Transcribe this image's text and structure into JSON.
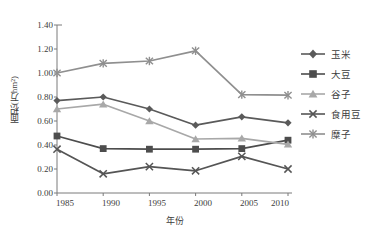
{
  "chart_data": {
    "type": "line",
    "title": "",
    "xlabel": "年份",
    "ylabel": "面积(万hm²)",
    "categories": [
      "1985",
      "1990",
      "1995",
      "2000",
      "2005",
      "2010"
    ],
    "x": [
      1985,
      1990,
      1995,
      2000,
      2005,
      2010
    ],
    "ylim": [
      0.0,
      1.4
    ],
    "ytick_labels": [
      "0.00",
      "0.20",
      "0.40",
      "0.60",
      "0.80",
      "1.00",
      "1.20",
      "1.40"
    ],
    "ytick_values": [
      0.0,
      0.2,
      0.4,
      0.6,
      0.8,
      1.0,
      1.2,
      1.4
    ],
    "grid": false,
    "legend_position": "right",
    "series": [
      {
        "name": "玉米",
        "marker": "diamond",
        "color": "#5a5a5a",
        "values": [
          0.77,
          0.8,
          0.7,
          0.565,
          0.635,
          0.585
        ]
      },
      {
        "name": "大豆",
        "marker": "square",
        "color": "#4d4d4d",
        "values": [
          0.475,
          0.37,
          0.365,
          0.365,
          0.37,
          0.44
        ]
      },
      {
        "name": "谷子",
        "marker": "triangle",
        "color": "#a8a8a8",
        "values": [
          0.7,
          0.74,
          0.6,
          0.45,
          0.455,
          0.405
        ]
      },
      {
        "name": "食用豆",
        "marker": "x",
        "color": "#555555",
        "values": [
          0.365,
          0.16,
          0.22,
          0.185,
          0.305,
          0.2
        ]
      },
      {
        "name": "糜子",
        "marker": "asterisk",
        "color": "#8f8f8f",
        "values": [
          1.0,
          1.08,
          1.1,
          1.185,
          0.82,
          0.815
        ]
      }
    ]
  },
  "axis": {
    "axis_color": "#7a7a7a",
    "text_color": "#3c3c3c"
  }
}
